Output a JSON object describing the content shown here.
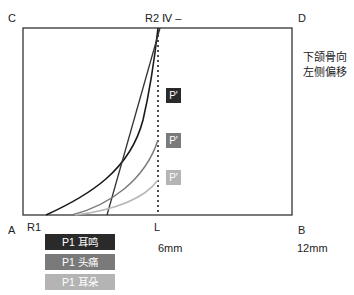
{
  "corners": {
    "top_left": "C",
    "top_right": "D",
    "bottom_left": "A",
    "bottom_right": "B"
  },
  "top_marker": "R2 Ⅳ –",
  "bottom_markers": {
    "r1": "R1",
    "l": "L"
  },
  "axis_values": {
    "mid": "6mm",
    "end": "12mm"
  },
  "side_note": {
    "line1": "下颌骨向",
    "line2": "左侧偏移"
  },
  "point_labels": [
    {
      "text": "P'",
      "color": "#2a2a2a"
    },
    {
      "text": "P'",
      "color": "#7a7a7a"
    },
    {
      "text": "P'",
      "color": "#b4b4b4"
    }
  ],
  "legend": [
    {
      "label": "P1 耳鸣",
      "color": "#2a2a2a"
    },
    {
      "label": "P1 头痛",
      "color": "#7a7a7a"
    },
    {
      "label": "P1 耳朵",
      "color": "#b4b4b4"
    }
  ],
  "colors": {
    "frame": "#333333",
    "curve_dark": "#1a1a1a",
    "curve_mid": "#7a7a7a",
    "curve_light": "#b8b8b8"
  }
}
